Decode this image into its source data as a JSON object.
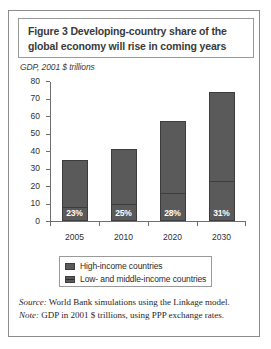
{
  "figure": {
    "title": "Figure 3  Developing-country share of the global economy will rise in coming years",
    "subtitle": "GDP, 2001 $ trillions"
  },
  "notes": {
    "source_keyword": "Source:",
    "source_text": " World Bank simulations using the Linkage model.",
    "note_keyword": "Note:",
    "note_text": " GDP in 2001 $ trillions, using PPP exchange rates."
  },
  "legend": {
    "items": [
      {
        "label": "High-income countries",
        "color": "#5a5a5a"
      },
      {
        "label": "Low- and middle-income countries",
        "color": "#5a5a5a"
      }
    ]
  },
  "chart_data": {
    "type": "bar",
    "stacked": true,
    "title": "Figure 3  Developing-country share of the global economy will rise in coming years",
    "subtitle": "GDP, 2001 $ trillions",
    "xlabel": "",
    "ylabel": "GDP, 2001 $ trillions",
    "ylim": [
      0,
      80
    ],
    "yticks": [
      0,
      10,
      20,
      30,
      40,
      50,
      60,
      70,
      80
    ],
    "ytick_labels": [
      "0",
      "10",
      "20",
      "30",
      "40",
      "50",
      "60",
      "70",
      "80"
    ],
    "grid": false,
    "legend_position": "bottom",
    "categories": [
      "2005",
      "2010",
      "2020",
      "2030"
    ],
    "series": [
      {
        "name": "High-income countries",
        "values": [
          27,
          31,
          41,
          51
        ]
      },
      {
        "name": "Low- and middle-income countries",
        "values": [
          8,
          10,
          16,
          23
        ]
      }
    ],
    "totals": [
      35,
      41,
      57,
      74
    ],
    "data_labels": [
      "23%",
      "25%",
      "28%",
      "31%"
    ],
    "data_label_meaning": "Low- and middle-income countries share of global GDP"
  }
}
